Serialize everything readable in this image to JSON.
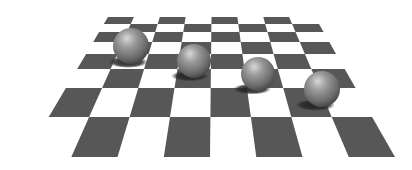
{
  "scene": {
    "description": "3D render: four gray spheres resting on a checkerboard plane in perspective",
    "width": 412,
    "height": 170,
    "background": "#ffffff"
  },
  "board": {
    "dark_color": "#575757",
    "light_color": "#ffffff",
    "top": {
      "y": 17,
      "x_left": 108,
      "x_right": 315
    },
    "bottom": {
      "y": 157,
      "x_left": 25,
      "x_right": 395
    },
    "row_edges_y": [
      17,
      24,
      32,
      42,
      54,
      69,
      88,
      117,
      157
    ],
    "columns": 8,
    "first_dark_col_top_row": 0
  },
  "spheres": [
    {
      "name": "sphere-1",
      "cx": 131,
      "cy": 46,
      "r": 18,
      "shadow": {
        "cx": 128,
        "cy": 62,
        "rx": 20,
        "ry": 6
      }
    },
    {
      "name": "sphere-2",
      "cx": 194,
      "cy": 61,
      "r": 17,
      "shadow": {
        "cx": 190,
        "cy": 76,
        "rx": 19,
        "ry": 5.5
      }
    },
    {
      "name": "sphere-3",
      "cx": 258,
      "cy": 74,
      "r": 17,
      "shadow": {
        "cx": 252,
        "cy": 89,
        "rx": 19,
        "ry": 5.5
      }
    },
    {
      "name": "sphere-4",
      "cx": 322,
      "cy": 89,
      "r": 18,
      "shadow": {
        "cx": 315,
        "cy": 105,
        "rx": 20,
        "ry": 6
      }
    }
  ],
  "sphere_colors": {
    "highlight": "#d8d8d8",
    "mid": "#8a8a8a",
    "dark": "#3e3e3e",
    "shadow": "#1e1e1e"
  }
}
